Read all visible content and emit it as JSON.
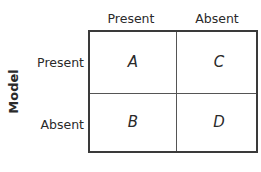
{
  "columns": [
    "Present",
    "Absent"
  ],
  "rows": [
    "Present",
    "Absent"
  ],
  "row_axis_label": "Model",
  "cells": {
    "A": "A",
    "B": "B",
    "C": "C",
    "D": "D"
  }
}
